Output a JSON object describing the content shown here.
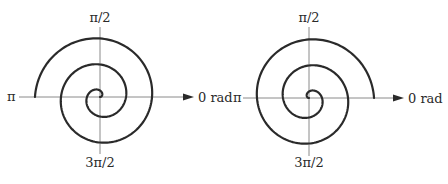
{
  "diagrams": [
    {
      "id": "left",
      "center": [
        100,
        97
      ],
      "axis_x": [
        19,
        194
      ],
      "axis_y": [
        27,
        154
      ],
      "spiral": {
        "k": 4.14,
        "turns": 2.5,
        "end_angle_rad": 3.14159,
        "direction": "counterclockwise"
      },
      "labels": {
        "top": "π/2",
        "left": "π",
        "right": "0 rad",
        "bottom": "3π/2"
      },
      "label_pos": {
        "top": [
          100,
          22
        ],
        "left": [
          7,
          101
        ],
        "right": [
          198,
          102
        ],
        "bottom": [
          100,
          167
        ]
      }
    },
    {
      "id": "right",
      "center": [
        309,
        98
      ],
      "axis_x": [
        243,
        404
      ],
      "axis_y": [
        27,
        156
      ],
      "spiral": {
        "k": 4.14,
        "turns": 2.5,
        "end_angle_rad": 0,
        "direction": "clockwise"
      },
      "labels": {
        "top": "π/2",
        "left": "π",
        "right": "0 rad",
        "bottom": "3π/2"
      },
      "label_pos": {
        "top": [
          309,
          22
        ],
        "left": [
          233,
          102
        ],
        "right": [
          408,
          103
        ],
        "bottom": [
          309,
          167
        ]
      }
    }
  ],
  "colors": {
    "axis": "#8a8a8a",
    "curve": "#2a2a2a",
    "background": "#ffffff"
  }
}
